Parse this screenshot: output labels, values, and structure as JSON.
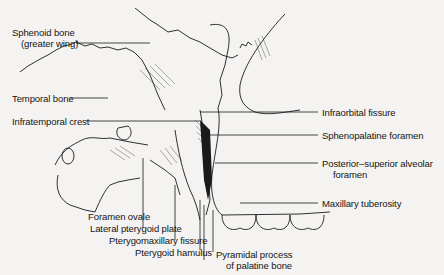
{
  "figure": {
    "type": "anatomical-diagram"
  },
  "labels": {
    "sphenoid_line1": "Sphenoid bone",
    "sphenoid_line2": "(greater wing)",
    "temporal_bone": "Temporal bone",
    "infratemporal_crest": "Infratemporal crest",
    "infraorbital_fissure": "Infraorbital fissure",
    "sphenopalatine_foramen": "Sphenopalatine foramen",
    "psa_foramen_line1": "Posterior–superior alveolar",
    "psa_foramen_line2": "foramen",
    "maxillary_tuberosity": "Maxillary tuberosity",
    "foramen_ovale": "Foramen ovale",
    "lateral_pterygoid_plate": "Lateral pterygoid plate",
    "pterygomaxillary_fissure": "Pterygomaxillary fissure",
    "pterygoid_hamulus": "Pterygoid hamulus",
    "pyramidal_line1": "Pyramidal process",
    "pyramidal_line2": "of palatine bone"
  },
  "colors": {
    "background": "#f4f3f1",
    "ink": "#141414"
  }
}
